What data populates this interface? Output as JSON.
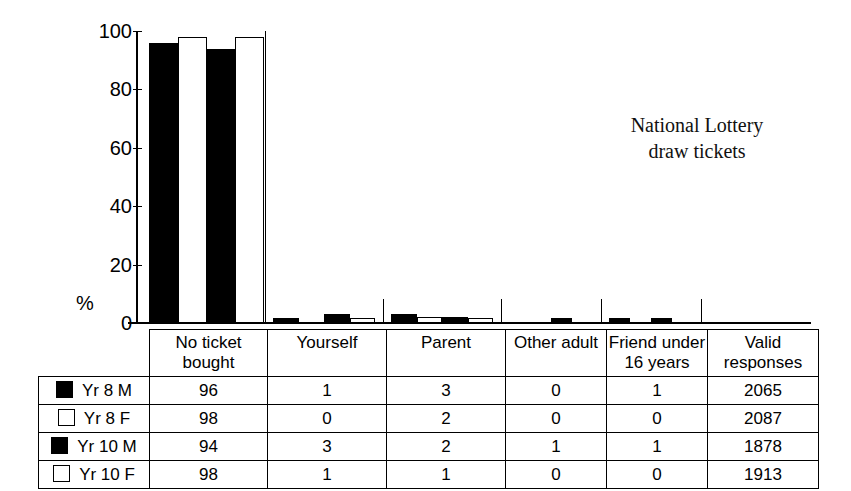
{
  "chart_data": {
    "type": "bar",
    "title": "National Lottery\ndraw tickets",
    "title_line1": "National Lottery",
    "title_line2": "draw tickets",
    "xlabel": "",
    "ylabel": "%",
    "ylim": [
      0,
      100
    ],
    "yticks": [
      0,
      20,
      40,
      60,
      80,
      100
    ],
    "grid": false,
    "legend_position": "table-left-column",
    "categories": [
      "No ticket bought",
      "Yourself",
      "Parent",
      "Other adult",
      "Friend under 16 years"
    ],
    "series": [
      {
        "name": "Yr 8 M",
        "fill": "black",
        "values": [
          96,
          1,
          3,
          0,
          1
        ]
      },
      {
        "name": "Yr 8 F",
        "fill": "white",
        "values": [
          98,
          0,
          2,
          0,
          0
        ]
      },
      {
        "name": "Yr 10 M",
        "fill": "black",
        "values": [
          94,
          3,
          2,
          1,
          1
        ]
      },
      {
        "name": "Yr 10 F",
        "fill": "white",
        "values": [
          98,
          1,
          1,
          0,
          0
        ]
      }
    ],
    "valid_responses": [
      2065,
      2087,
      1878,
      1913
    ]
  },
  "table": {
    "header_blank": "",
    "columns": [
      {
        "line1": "No ticket",
        "line2": "bought"
      },
      {
        "line1": "Yourself",
        "line2": ""
      },
      {
        "line1": "Parent",
        "line2": ""
      },
      {
        "line1": "Other adult",
        "line2": ""
      },
      {
        "line1": "Friend under",
        "line2": "16 years"
      },
      {
        "line1": "Valid",
        "line2": "responses"
      }
    ],
    "rows": [
      {
        "label": "Yr 8 M",
        "swatch": "filled",
        "cells": [
          "96",
          "1",
          "3",
          "0",
          "1",
          "2065"
        ]
      },
      {
        "label": "Yr 8 F",
        "swatch": "hollow",
        "cells": [
          "98",
          "0",
          "2",
          "0",
          "0",
          "2087"
        ]
      },
      {
        "label": "Yr 10 M",
        "swatch": "filled",
        "cells": [
          "94",
          "3",
          "2",
          "1",
          "1",
          "1878"
        ]
      },
      {
        "label": "Yr 10 F",
        "swatch": "hollow",
        "cells": [
          "98",
          "1",
          "1",
          "0",
          "0",
          "1913"
        ]
      }
    ]
  },
  "axis": {
    "percent_symbol": "%",
    "ticks": [
      "100",
      "80",
      "60",
      "40",
      "20",
      "0"
    ]
  },
  "colors": {
    "ink": "#000000",
    "paper": "#ffffff"
  }
}
